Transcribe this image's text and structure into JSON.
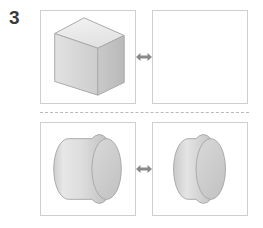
{
  "page": {
    "question_number": "3",
    "background_color": "#ffffff"
  },
  "colors": {
    "panel_border": "#cfcfcf",
    "divider": "#b9b9b9",
    "arrow": "#8a8a8a",
    "shape_outline": "#a9a9a9",
    "shape_top_face": "#ededed",
    "shape_front_face": "#d8d8d8",
    "shape_side_face": "#c4c4c4",
    "cylinder_body_light": "#e6e6e6",
    "cylinder_body_dark": "#bdbdbd",
    "cylinder_cap": "#cfcfcf",
    "number_color": "#3a3a3a"
  },
  "rows": [
    {
      "id": "row-top",
      "relation_icon": "double-arrow-icon",
      "left_panel": {
        "id": "panel-top-left",
        "shape": "rectangular-box",
        "shape_label": "3D rectangular box (cuboid) shown in perspective",
        "empty": false
      },
      "right_panel": {
        "id": "panel-top-right",
        "shape": "none",
        "shape_label": "empty answer panel",
        "empty": true
      }
    },
    {
      "id": "row-bottom",
      "relation_icon": "double-arrow-icon",
      "left_panel": {
        "id": "panel-bottom-left",
        "shape": "wide-cylinder",
        "shape_label": "wide cylinder shown in perspective",
        "empty": false
      },
      "right_panel": {
        "id": "panel-bottom-right",
        "shape": "narrow-cylinder",
        "shape_label": "narrow cylinder / disc shown in perspective",
        "empty": false
      }
    }
  ]
}
